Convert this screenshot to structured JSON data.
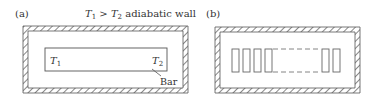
{
  "panel_a": {
    "label": "(a)",
    "caption_t1": "T",
    "caption_t1_sub": "1",
    "caption_gt": " > ",
    "caption_t2": "T",
    "caption_t2_sub": "2",
    "caption_rest": " adiabatic wall",
    "bar_left_label": "T",
    "bar_left_sub": "1",
    "bar_right_label": "T",
    "bar_right_sub": "2",
    "bar_callout": "Bar"
  },
  "panel_b": {
    "label": "(b)",
    "segments_left_count": 4,
    "segments_right_count": 2
  },
  "colors": {
    "line": "#555555",
    "text": "#333333",
    "background": "#ffffff"
  }
}
